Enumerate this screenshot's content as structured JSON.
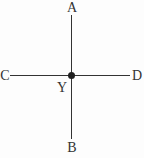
{
  "diagram": {
    "labels": {
      "top": "A",
      "bottom": "B",
      "left": "C",
      "right": "D",
      "center": "Y"
    },
    "colors": {
      "line": "#333333",
      "dot": "#1f1f1f",
      "text": "#333333",
      "background": "#fdfdfd"
    }
  }
}
